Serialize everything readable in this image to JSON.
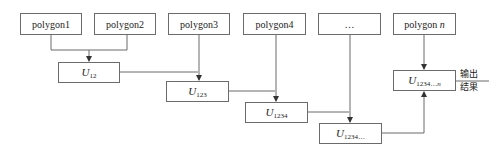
{
  "diagram": {
    "inputs": [
      {
        "id": "p1",
        "label": "polygon1"
      },
      {
        "id": "p2",
        "label": "polygon2"
      },
      {
        "id": "p3",
        "label": "polygon3"
      },
      {
        "id": "p4",
        "label": "polygon4"
      },
      {
        "id": "pdots",
        "label": "…"
      },
      {
        "id": "pn",
        "label_main": "polygon ",
        "label_var": "n"
      }
    ],
    "unions": [
      {
        "id": "u12",
        "symbol": "U",
        "subscript": "12"
      },
      {
        "id": "u123",
        "symbol": "U",
        "subscript": "123"
      },
      {
        "id": "u1234",
        "symbol": "U",
        "subscript": "1234"
      },
      {
        "id": "u1234dots",
        "symbol": "U",
        "subscript": "1234…"
      },
      {
        "id": "u1234n",
        "symbol": "U",
        "subscript_main": "1234…",
        "subscript_var": "n"
      }
    ],
    "output": {
      "line1": "输出",
      "line2": "结果"
    },
    "line_color": "#6b6b6b"
  }
}
